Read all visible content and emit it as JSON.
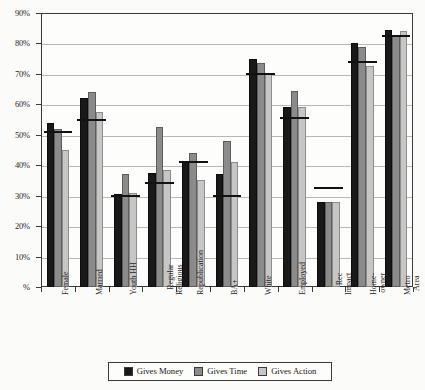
{
  "chart_data": {
    "type": "bar",
    "title": "Black line represents proportion in sample (weighted)",
    "xlabel": "",
    "ylabel": "",
    "ylim": [
      0,
      90
    ],
    "grid": true,
    "legend_position": "bottom",
    "ytick_labels": [
      "90%",
      "80%",
      "70%",
      "60%",
      "50%",
      "40%",
      "30%",
      "20%",
      "10%",
      "%"
    ],
    "ytick_values": [
      90,
      80,
      70,
      60,
      50,
      40,
      30,
      20,
      10,
      0
    ],
    "categories": [
      "Female",
      "Married",
      "Youth HH",
      "Regular\nReligious",
      "Republication",
      "BA+",
      "White",
      "Employed",
      "Rec\nImpact",
      "Home-\nowner",
      "Metro\nArea"
    ],
    "series": [
      {
        "name": "Gives Money",
        "color": "#191919",
        "values": [
          54,
          62,
          30.5,
          37.5,
          41.5,
          37,
          75,
          59,
          28,
          80,
          84.5
        ]
      },
      {
        "name": "Gives Time",
        "color": "#8b8b8b",
        "values": [
          52,
          64,
          37,
          52.5,
          44,
          48,
          73.5,
          64.5,
          28,
          79,
          82.5
        ]
      },
      {
        "name": "Gives Action",
        "color": "#c6c6c6",
        "values": [
          45,
          57.5,
          31,
          38.5,
          35,
          41,
          70,
          59,
          28,
          72.5,
          84
        ]
      }
    ],
    "reference_line": {
      "name": "proportion in sample (weighted)",
      "color": "#121212",
      "values": [
        51,
        55,
        30,
        34,
        41,
        30,
        70,
        55.5,
        32.5,
        74,
        82.5
      ]
    }
  },
  "legend": {
    "items": [
      {
        "label": "Gives Money"
      },
      {
        "label": "Gives Time"
      },
      {
        "label": "Gives Action"
      }
    ]
  }
}
